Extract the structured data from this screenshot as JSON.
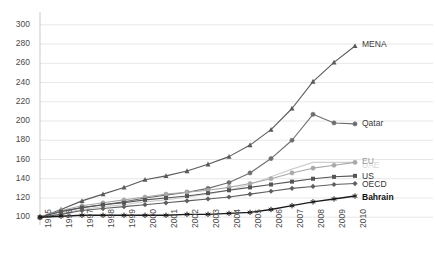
{
  "chart_data": {
    "type": "line",
    "title": "",
    "subtitle": "",
    "xlabel": "",
    "ylabel": "",
    "x": [
      1995,
      1996,
      1997,
      1998,
      1999,
      2000,
      2001,
      2002,
      2003,
      2004,
      2005,
      2006,
      2007,
      2008,
      2009,
      2010
    ],
    "xticklabels": [
      "1995",
      "1996",
      "1997",
      "1998",
      "1999",
      "2000",
      "2001",
      "2002",
      "2003",
      "2004",
      "2005",
      "2006",
      "2007",
      "2008",
      "2009",
      "2010"
    ],
    "yticklabels": [
      "100",
      "120",
      "140",
      "160",
      "180",
      "200",
      "220",
      "240",
      "260",
      "280",
      "300"
    ],
    "ylim": [
      94,
      305
    ],
    "yticks": [
      100,
      120,
      140,
      160,
      180,
      200,
      220,
      240,
      260,
      280,
      300
    ],
    "grid": true,
    "grid_axis": "y",
    "legend": "right-endpoint-labels",
    "series": [
      {
        "name": "MENA",
        "color": "#5a5a5a",
        "marker": "triangle",
        "label_color": "#3c3c3c",
        "label_bold": false,
        "values": [
          100,
          108,
          117,
          124,
          131,
          139,
          143,
          148,
          155,
          163,
          175,
          191,
          213,
          241,
          261,
          278
        ]
      },
      {
        "name": "Qatar",
        "color": "#6e6e6e",
        "marker": "circle",
        "label_color": "#3c3c3c",
        "label_bold": false,
        "values": [
          100,
          106,
          110,
          113,
          116,
          120,
          123,
          126,
          130,
          136,
          146,
          161,
          180,
          207,
          198,
          197
        ]
      },
      {
        "name": "UAE",
        "color": "#cfcfcf",
        "marker": "none",
        "label_color": "#d8d8d8",
        "label_bold": false,
        "values": [
          100,
          104,
          108,
          111,
          113,
          116,
          118,
          121,
          124,
          128,
          134,
          142,
          150,
          157,
          157,
          157
        ]
      },
      {
        "name": "EU",
        "color": "#a8a8a8",
        "marker": "circle",
        "label_color": "#9a9a9a",
        "label_bold": false,
        "values": [
          100,
          107,
          112,
          115,
          118,
          121,
          124,
          126,
          128,
          131,
          135,
          140,
          146,
          151,
          154,
          157
        ]
      },
      {
        "name": "US",
        "color": "#555555",
        "marker": "square",
        "label_color": "#333333",
        "label_bold": false,
        "values": [
          100,
          106,
          110,
          113,
          115,
          118,
          120,
          122,
          125,
          128,
          131,
          134,
          137,
          140,
          142,
          143
        ]
      },
      {
        "name": "OECD",
        "color": "#5f5f5f",
        "marker": "diamond",
        "label_color": "#333333",
        "label_bold": false,
        "values": [
          100,
          103,
          107,
          109,
          111,
          113,
          115,
          117,
          119,
          121,
          124,
          127,
          130,
          132,
          134,
          135
        ]
      },
      {
        "name": "Bahrain",
        "color": "#1a1a1a",
        "marker": "asterisk",
        "label_color": "#111111",
        "label_bold": true,
        "values": [
          100,
          101,
          102,
          102,
          102,
          102,
          102,
          103,
          103,
          104,
          105,
          108,
          112,
          116,
          119,
          122
        ]
      }
    ]
  },
  "ghost_header": ""
}
